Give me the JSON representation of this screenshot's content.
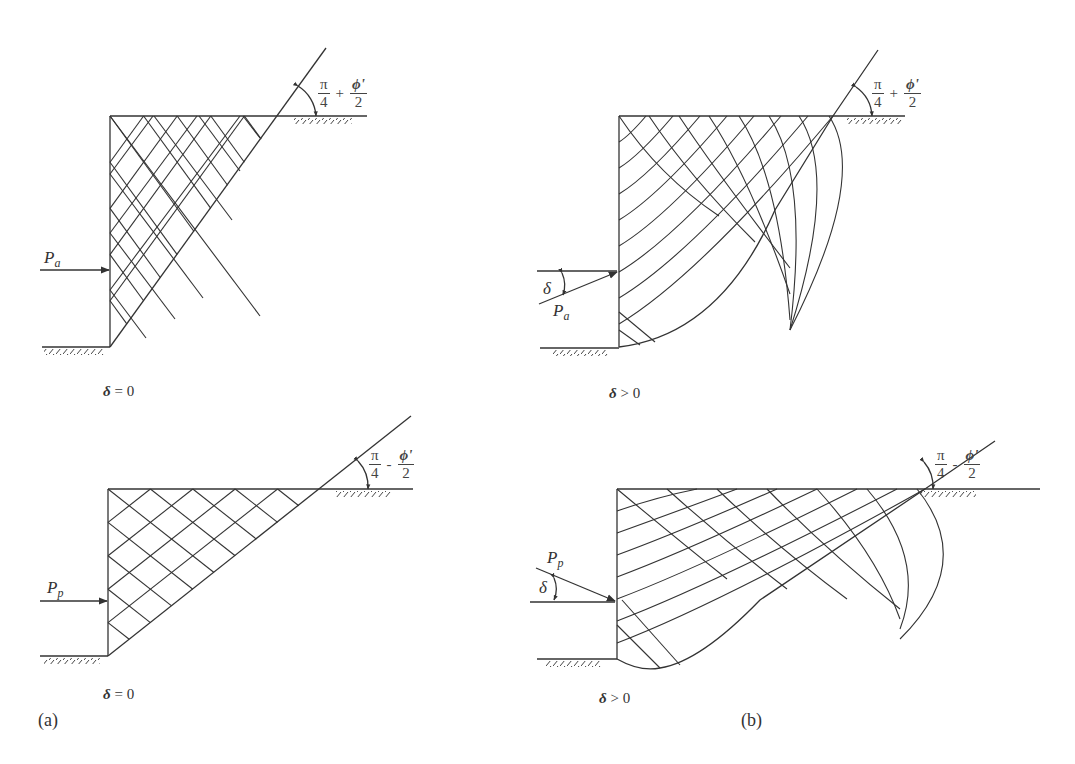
{
  "figure": {
    "panels": {
      "a": {
        "tag": "(a)"
      },
      "b": {
        "tag": "(b)"
      }
    },
    "active_a": {
      "force_symbol": "P",
      "force_subscript": "a",
      "angle_num": "π",
      "angle_den": "4",
      "angle_op": "+",
      "angle_phi": "ϕ'",
      "angle_phi_den": "2",
      "caption_symbol": "δ",
      "caption_rest": " = 0"
    },
    "active_b": {
      "force_symbol": "P",
      "force_subscript": "a",
      "delta_label": "δ",
      "angle_num": "π",
      "angle_den": "4",
      "angle_op": "+",
      "angle_phi": "ϕ'",
      "angle_phi_den": "2",
      "caption_symbol": "δ",
      "caption_rest": " > 0"
    },
    "passive_a": {
      "force_symbol": "P",
      "force_subscript": "p",
      "angle_num": "π",
      "angle_den": "4",
      "angle_op": "-",
      "angle_phi": "ϕ'",
      "angle_phi_den": "2",
      "caption_symbol": "δ",
      "caption_rest": " = 0"
    },
    "passive_b": {
      "force_symbol": "P",
      "force_subscript": "p",
      "delta_label": "δ",
      "angle_num": "π",
      "angle_den": "4",
      "angle_op": "-",
      "angle_phi": "ϕ'",
      "angle_phi_den": "2",
      "caption_symbol": "δ",
      "caption_rest": " > 0"
    }
  },
  "colors": {
    "line": "#333333",
    "background": "#ffffff"
  }
}
